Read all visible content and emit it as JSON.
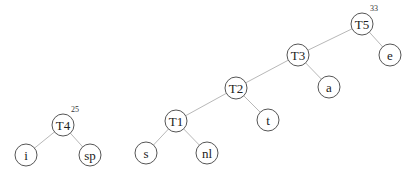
{
  "diagram": {
    "type": "huffman-trees",
    "trees": [
      {
        "root": "T4",
        "weight": "25",
        "nodes": [
          {
            "id": "T4",
            "label": "T4",
            "x": 63,
            "y": 125
          },
          {
            "id": "i",
            "label": "i",
            "x": 26,
            "y": 155
          },
          {
            "id": "sp",
            "label": "sp",
            "x": 90,
            "y": 155
          }
        ],
        "edges": [
          [
            "T4",
            "i"
          ],
          [
            "T4",
            "sp"
          ]
        ]
      },
      {
        "root": "T5",
        "weight": "33",
        "nodes": [
          {
            "id": "T5",
            "label": "T5",
            "x": 362,
            "y": 24
          },
          {
            "id": "e",
            "label": "e",
            "x": 390,
            "y": 55
          },
          {
            "id": "T3",
            "label": "T3",
            "x": 298,
            "y": 55
          },
          {
            "id": "a",
            "label": "a",
            "x": 329,
            "y": 87
          },
          {
            "id": "T2",
            "label": "T2",
            "x": 236,
            "y": 88
          },
          {
            "id": "t",
            "label": "t",
            "x": 268,
            "y": 120
          },
          {
            "id": "T1",
            "label": "T1",
            "x": 176,
            "y": 121
          },
          {
            "id": "s",
            "label": "s",
            "x": 146,
            "y": 153
          },
          {
            "id": "nl",
            "label": "nl",
            "x": 207,
            "y": 153
          }
        ],
        "edges": [
          [
            "T5",
            "T3"
          ],
          [
            "T5",
            "e"
          ],
          [
            "T3",
            "T2"
          ],
          [
            "T3",
            "a"
          ],
          [
            "T2",
            "T1"
          ],
          [
            "T2",
            "t"
          ],
          [
            "T1",
            "s"
          ],
          [
            "T1",
            "nl"
          ]
        ]
      }
    ],
    "colors": {
      "edge": "#b8b8b8",
      "node_stroke": "#555555",
      "text": "#222222"
    }
  }
}
